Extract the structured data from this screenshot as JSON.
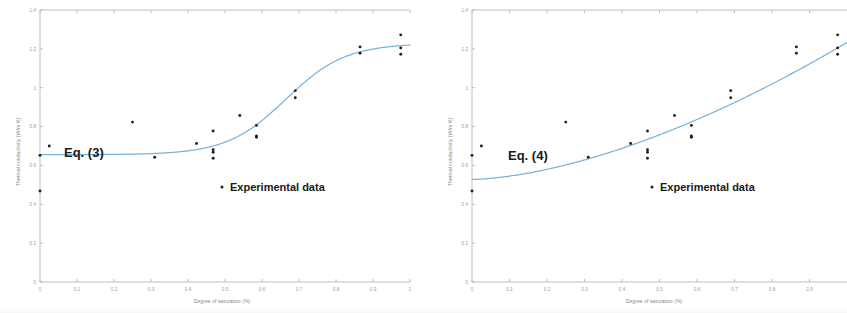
{
  "figure": {
    "background_color": "#ffffff",
    "fit_line_color": "#79b4dc",
    "point_color": "#1f1f1f",
    "axis_color": "#b9b9b9",
    "tick_label_color": "#9a9a9a"
  },
  "panels": [
    {
      "id": "panel-left",
      "equation_label": "Eq. (3)",
      "legend_label": "Experimental data",
      "legend_marker": "dot-marker"
    },
    {
      "id": "panel-right",
      "equation_label": "Eq. (4)",
      "legend_label": "Experimental data",
      "legend_marker": "dot-marker"
    }
  ],
  "chart_data": [
    {
      "type": "scatter",
      "title": "",
      "xlabel": "Degree of saturation (%)",
      "ylabel": "Thermal conductivity (W/m·K)",
      "xlim": [
        0,
        1
      ],
      "ylim": [
        0,
        1.4
      ],
      "xticks": [
        0,
        0.1,
        0.2,
        0.3,
        0.4,
        0.5,
        0.6,
        0.7,
        0.8,
        0.9,
        1
      ],
      "xticklabels": [
        "0",
        "0.1",
        "0.2",
        "0.3",
        "0.4",
        "0.5",
        "0.6",
        "0.7",
        "0.8",
        "0.9",
        "1"
      ],
      "yticks": [
        0,
        0.2,
        0.4,
        0.6,
        0.8,
        1,
        1.2,
        1.4
      ],
      "yticklabels": [
        "0",
        "0.2",
        "0.4",
        "0.6",
        "0.8",
        "1",
        "1.2",
        "1.4"
      ],
      "grid": false,
      "legend_position": "inside-center-right",
      "annotations": [
        {
          "text": "Eq. (3)",
          "x": 0.14,
          "y": 0.7
        },
        {
          "text": "Experimental data",
          "x": 0.55,
          "y": 0.465
        }
      ],
      "series": [
        {
          "name": "Experimental data",
          "kind": "scatter",
          "points": [
            [
              0.0,
              0.468
            ],
            [
              0.0,
              0.652
            ],
            [
              0.025,
              0.7
            ],
            [
              0.25,
              0.823
            ],
            [
              0.31,
              0.642
            ],
            [
              0.423,
              0.713
            ],
            [
              0.468,
              0.777
            ],
            [
              0.468,
              0.681
            ],
            [
              0.468,
              0.668
            ],
            [
              0.468,
              0.637
            ],
            [
              0.54,
              0.857
            ],
            [
              0.585,
              0.806
            ],
            [
              0.585,
              0.752
            ],
            [
              0.585,
              0.745
            ],
            [
              0.69,
              0.985
            ],
            [
              0.69,
              0.948
            ],
            [
              0.865,
              1.21
            ],
            [
              0.865,
              1.178
            ],
            [
              0.975,
              1.272
            ],
            [
              0.975,
              1.205
            ],
            [
              0.975,
              1.172
            ]
          ]
        },
        {
          "name": "Eq. (3)",
          "kind": "line",
          "curve": "sigmoid",
          "params": {
            "low": 0.655,
            "high": 1.228,
            "midpoint": 0.665,
            "steepness": 12.5
          }
        }
      ]
    },
    {
      "type": "scatter",
      "title": "",
      "xlabel": "Degree of saturation (%)",
      "ylabel": "Thermal conductivity (W/m·K)",
      "xlim": [
        0,
        1
      ],
      "ylim": [
        0,
        1.4
      ],
      "xticks": [
        0,
        0.1,
        0.2,
        0.3,
        0.4,
        0.5,
        0.6,
        0.7,
        0.8,
        0.9
      ],
      "xticklabels": [
        "0",
        "0.1",
        "0.2",
        "0.3",
        "0.4",
        "0.5",
        "0.6",
        "0.7",
        "0.8",
        "0.9"
      ],
      "yticks": [
        0,
        0.2,
        0.4,
        0.6,
        0.8,
        1,
        1.2,
        1.4
      ],
      "yticklabels": [
        "0",
        "0.2",
        "0.4",
        "0.6",
        "0.8",
        "1",
        "1.2",
        "1.4"
      ],
      "grid": false,
      "legend_position": "inside-center-right",
      "annotations": [
        {
          "text": "Eq. (4)",
          "x": 0.16,
          "y": 0.655
        },
        {
          "text": "Experimental data",
          "x": 0.55,
          "y": 0.465
        }
      ],
      "series": [
        {
          "name": "Experimental data",
          "kind": "scatter",
          "points": [
            [
              0.0,
              0.468
            ],
            [
              0.0,
              0.652
            ],
            [
              0.025,
              0.7
            ],
            [
              0.25,
              0.823
            ],
            [
              0.31,
              0.642
            ],
            [
              0.423,
              0.713
            ],
            [
              0.468,
              0.777
            ],
            [
              0.468,
              0.681
            ],
            [
              0.468,
              0.668
            ],
            [
              0.468,
              0.637
            ],
            [
              0.54,
              0.857
            ],
            [
              0.585,
              0.806
            ],
            [
              0.585,
              0.752
            ],
            [
              0.585,
              0.745
            ],
            [
              0.69,
              0.985
            ],
            [
              0.69,
              0.948
            ],
            [
              0.865,
              1.21
            ],
            [
              0.865,
              1.178
            ],
            [
              0.975,
              1.272
            ],
            [
              0.975,
              1.205
            ],
            [
              0.975,
              1.172
            ]
          ]
        },
        {
          "name": "Eq. (4)",
          "kind": "line",
          "curve": "power",
          "params": {
            "intercept": 0.528,
            "amplitude": 0.705,
            "exponent": 1.62
          }
        }
      ]
    }
  ]
}
